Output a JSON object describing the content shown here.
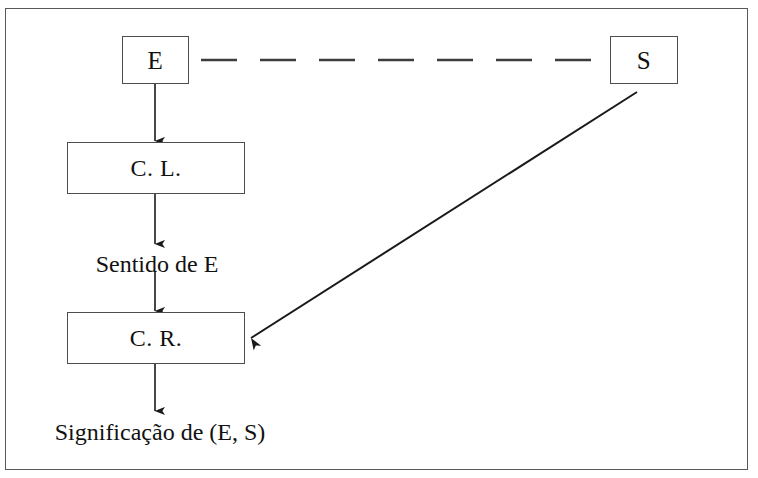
{
  "figure": {
    "background_color": "#ffffff",
    "border_color": "#595959",
    "stroke_color": "#1a1a1a"
  },
  "nodes": {
    "e": {
      "label": "E"
    },
    "s": {
      "label": "S"
    },
    "cl": {
      "label": "C. L."
    },
    "cr": {
      "label": "C. R."
    }
  },
  "texts": {
    "sentido": "Sentido de E",
    "significacao": "Significação de (E, S)"
  },
  "connectors": {
    "e_to_s_dashed": {
      "style": "dashed",
      "dash_count": 7
    },
    "e_to_cl": {
      "style": "solid-arrow"
    },
    "cl_to_sentido": {
      "style": "solid-arrow"
    },
    "sentido_to_cr": {
      "style": "solid-arrow"
    },
    "cr_to_significacao": {
      "style": "solid-arrow"
    },
    "s_to_cr_diagonal": {
      "style": "solid-arrow"
    }
  }
}
